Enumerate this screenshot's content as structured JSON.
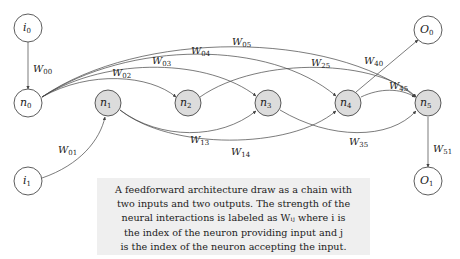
{
  "nodes": [
    {
      "id": "i0",
      "base": "i",
      "sub": "0",
      "x": 28,
      "y": 28,
      "fill": "#ffffff"
    },
    {
      "id": "n0",
      "base": "n",
      "sub": "0",
      "x": 28,
      "y": 103,
      "fill": "#ffffff"
    },
    {
      "id": "n1",
      "base": "n",
      "sub": "1",
      "x": 108,
      "y": 103,
      "fill": "#dcdcdc"
    },
    {
      "id": "n2",
      "base": "n",
      "sub": "2",
      "x": 188,
      "y": 103,
      "fill": "#dcdcdc"
    },
    {
      "id": "n3",
      "base": "n",
      "sub": "3",
      "x": 268,
      "y": 103,
      "fill": "#dcdcdc"
    },
    {
      "id": "n4",
      "base": "n",
      "sub": "4",
      "x": 348,
      "y": 103,
      "fill": "#dcdcdc"
    },
    {
      "id": "n5",
      "base": "n",
      "sub": "5",
      "x": 428,
      "y": 103,
      "fill": "#dcdcdc"
    },
    {
      "id": "O0",
      "base": "O",
      "sub": "0",
      "x": 428,
      "y": 30,
      "fill": "#ffffff"
    },
    {
      "id": "i1",
      "base": "i",
      "sub": "1",
      "x": 28,
      "y": 181,
      "fill": "#ffffff"
    },
    {
      "id": "O1",
      "base": "O",
      "sub": "1",
      "x": 428,
      "y": 181,
      "fill": "#ffffff"
    }
  ],
  "edges": [
    {
      "label": "W",
      "sub": "00",
      "from": "i0",
      "to": "n0"
    },
    {
      "label": "W",
      "sub": "01",
      "from": "i1",
      "to": "n1"
    },
    {
      "label": "W",
      "sub": "02",
      "from": "n0",
      "to": "n2"
    },
    {
      "label": "W",
      "sub": "03",
      "from": "n0",
      "to": "n3"
    },
    {
      "label": "W",
      "sub": "04",
      "from": "n0",
      "to": "n4"
    },
    {
      "label": "W",
      "sub": "05",
      "from": "n0",
      "to": "n5"
    },
    {
      "label": "W",
      "sub": "13",
      "from": "n1",
      "to": "n3"
    },
    {
      "label": "W",
      "sub": "14",
      "from": "n1",
      "to": "n4"
    },
    {
      "label": "W",
      "sub": "25",
      "from": "n2",
      "to": "n5"
    },
    {
      "label": "W",
      "sub": "35",
      "from": "n3",
      "to": "n5"
    },
    {
      "label": "W",
      "sub": "40",
      "from": "n4",
      "to": "O0"
    },
    {
      "label": "W",
      "sub": "45",
      "from": "n4",
      "to": "n5"
    },
    {
      "label": "W",
      "sub": "51",
      "from": "n5",
      "to": "O1"
    }
  ],
  "caption": {
    "lines": [
      "A feedforward architecture draw as a chain with",
      "two inputs and two outputs. The strength of the",
      "neural interactions is labeled as Wᵢⱼ where i is",
      "the index of the neuron providing input and j",
      "is the index of the neuron accepting the input."
    ]
  }
}
